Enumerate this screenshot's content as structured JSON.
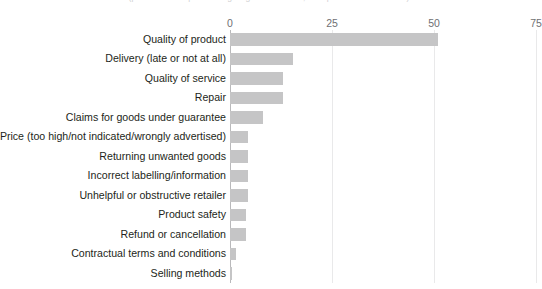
{
  "chart_data": {
    "type": "bar",
    "orientation": "horizontal",
    "title": "(per cent of respondents giving each answer; multiple answers allowed)",
    "xlabel": "",
    "ylabel": "",
    "xlim": [
      0,
      75
    ],
    "xticks": [
      "0",
      "25",
      "50",
      "75"
    ],
    "xtick_values": [
      0,
      25,
      50,
      75
    ],
    "grid": true,
    "legend": false,
    "bar_color": "#c5c5c6",
    "categories": [
      "Quality of product",
      "Delivery (late or not at all)",
      "Quality of service",
      "Repair",
      "Claims for goods under guarantee",
      "Price (too high/not indicated/wrongly advertised)",
      "Returning unwanted goods",
      "Incorrect labelling/information",
      "Unhelpful or obstructive retailer",
      "Product safety",
      "Refund or cancellation",
      "Contractual terms and conditions",
      "Selling methods"
    ],
    "values": [
      51,
      15.5,
      13,
      13,
      8,
      4.5,
      4.5,
      4.5,
      4.5,
      4,
      4,
      1.5,
      0.5
    ]
  }
}
